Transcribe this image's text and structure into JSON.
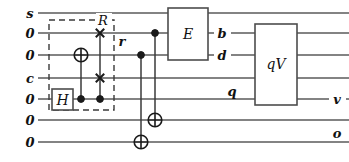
{
  "figure": {
    "kind": "quantum-circuit-diagram",
    "width": 349,
    "height": 162,
    "background_color": "#ffffff",
    "wire_color": "#5a5a5a",
    "ink_color": "#1a1a1a"
  },
  "wires": [
    {
      "index": 1,
      "y": 13,
      "input_label": "s"
    },
    {
      "index": 2,
      "y": 33,
      "input_label": "0"
    },
    {
      "index": 3,
      "y": 55,
      "input_label": "0"
    },
    {
      "index": 4,
      "y": 78,
      "input_label": "c"
    },
    {
      "index": 5,
      "y": 99,
      "input_label": "0"
    },
    {
      "index": 6,
      "y": 120,
      "input_label": "0"
    },
    {
      "index": 7,
      "y": 142,
      "input_label": "0"
    }
  ],
  "input_labels": {
    "w1": "s",
    "w2": "0",
    "w3": "0",
    "w4": "c",
    "w5": "0",
    "w6": "0",
    "w7": "0"
  },
  "mid_labels": {
    "r": "r",
    "b": "b",
    "d": "d",
    "q": "q"
  },
  "output_labels": {
    "v": "v",
    "o": "o"
  },
  "group": {
    "label": "R",
    "label_x": 103,
    "label_y": 21,
    "x": 49,
    "y": 20,
    "width": 65,
    "height": 90,
    "style": "dashed"
  },
  "gates": [
    {
      "id": "hadamard",
      "label": "H",
      "x": 52,
      "y": 89,
      "width": 21,
      "height": 21,
      "wires": [
        5
      ]
    },
    {
      "id": "entangler",
      "label": "E",
      "x": 168,
      "y": 8,
      "width": 40,
      "height": 52,
      "wires": [
        2,
        3
      ]
    },
    {
      "id": "qv",
      "label": "qV",
      "x": 255,
      "y": 24,
      "width": 42,
      "height": 81,
      "wires": [
        2,
        3,
        4,
        5
      ]
    }
  ],
  "cnots": [
    {
      "id": "cnot-1",
      "x": 81,
      "control_wire": 5,
      "target_wire": 3
    },
    {
      "id": "cnot-2",
      "x": 141,
      "control_wire": 3,
      "target_wire": 7
    },
    {
      "id": "cnot-3",
      "x": 155,
      "control_wire": 2,
      "target_wire": 6
    }
  ],
  "cswaps": [
    {
      "id": "cswap-1",
      "x": 100,
      "control_wire": 5,
      "swap_wires": [
        2,
        4
      ]
    }
  ],
  "label_positions": {
    "r": {
      "x": 122,
      "y": 46
    },
    "b": {
      "x": 222,
      "y": 38
    },
    "d": {
      "x": 222,
      "y": 60
    },
    "q": {
      "x": 232,
      "y": 96
    },
    "v": {
      "x": 336,
      "y": 104
    },
    "o": {
      "x": 336,
      "y": 138
    }
  }
}
